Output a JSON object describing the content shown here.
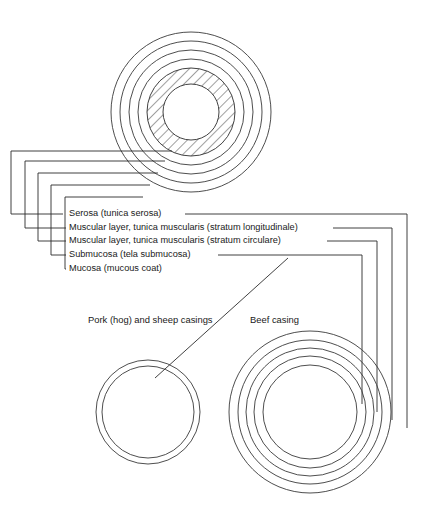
{
  "figure": {
    "background_color": "#ffffff",
    "line_color": "#2b2b2b",
    "text_color": "#1a1a1a",
    "width": 423,
    "height": 532
  },
  "layer_labels": [
    {
      "id": "serosa",
      "text": "Serosa (tunica serosa)",
      "label_x": 69,
      "label_y": 214,
      "order": 1
    },
    {
      "id": "muscularis-longitudinal",
      "text": "Muscular layer, tunica muscularis (stratum longitudinale)",
      "label_x": 69,
      "label_y": 228,
      "order": 2
    },
    {
      "id": "muscularis-circular",
      "text": "Muscular layer, tunica muscularis (stratum circulare)",
      "label_x": 69,
      "label_y": 241,
      "order": 3
    },
    {
      "id": "submucosa",
      "text": "Submucosa (tela submucosa)",
      "label_x": 69,
      "label_y": 255,
      "order": 4
    },
    {
      "id": "mucosa",
      "text": "Mucosa (mucous coat)",
      "label_x": 69,
      "label_y": 269,
      "order": 5
    }
  ],
  "captions": [
    {
      "id": "pork-sheep-caption",
      "text": "Pork (hog) and sheep casings",
      "x": 88,
      "y": 321
    },
    {
      "id": "beef-caption",
      "text": "Beef casing",
      "x": 250,
      "y": 321
    }
  ],
  "diagrams": {
    "detail_cross_section": {
      "name": "layer-detail-cross-section",
      "center_x": 191,
      "center_y": 112,
      "radii": [
        80,
        71,
        62,
        53,
        44,
        28
      ],
      "hatched_ring_outer": 44,
      "hatched_ring_inner": 28,
      "hatch_angle_deg": 45
    },
    "pork_sheep_casing": {
      "name": "pork-sheep-casing-cross-section",
      "center_x": 148,
      "center_y": 412,
      "radii": [
        52,
        46
      ]
    },
    "beef_casing": {
      "name": "beef-casing-cross-section",
      "center_x": 310,
      "center_y": 412,
      "radii": [
        81,
        72,
        64,
        56,
        47
      ]
    }
  },
  "leader_geometry": {
    "left_verticals_x": [
      11,
      25,
      38,
      51,
      65
    ],
    "left_turn_y": [
      214,
      228,
      241,
      255,
      269
    ],
    "attach_y": [
      151,
      161,
      173,
      185,
      197
    ],
    "attach_x_end": [
      172,
      165,
      158,
      150,
      143
    ],
    "right_verticals_x": [
      407,
      392,
      377,
      362
    ],
    "right_end_y": [
      428,
      420,
      412,
      404
    ],
    "label_line_start_x": [
      185,
      333,
      327,
      218
    ],
    "label_line_y": [
      214,
      228,
      241,
      255
    ]
  }
}
